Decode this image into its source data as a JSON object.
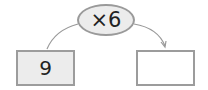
{
  "operation": {
    "label": "×6",
    "operator": "×",
    "operand": 6
  },
  "input_box": {
    "value": "9"
  },
  "output_box": {
    "value": ""
  },
  "colors": {
    "shape_fill": "#ececec",
    "border": "#9a9a9a"
  }
}
